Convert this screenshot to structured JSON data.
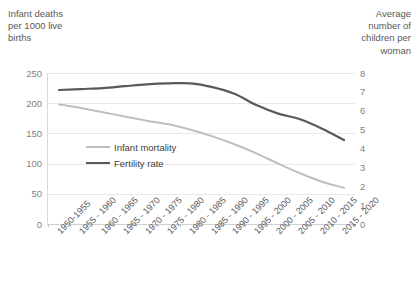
{
  "chart_data": {
    "type": "line",
    "title": "",
    "subtitle": "",
    "xlabel": "",
    "ylabel": "Infant deaths per 1000 live births",
    "y2label": "Average number of children per woman",
    "grid": true,
    "legend_position": "inside-left",
    "categories": [
      "1950-1955",
      "1955 - 1960",
      "1960 - 1965",
      "1965 - 1970",
      "1970 - 1975",
      "1975 - 1980",
      "1980 - 1985",
      "1985 - 1990",
      "1990 - 1995",
      "1995 - 2000",
      "2000 - 2005",
      "2005 - 2010",
      "2010 - 2015",
      "2015 - 2020"
    ],
    "ylim": [
      0,
      250
    ],
    "y2lim": [
      0,
      8
    ],
    "yticks": [
      "0",
      "50",
      "100",
      "150",
      "200",
      "250"
    ],
    "y2ticks": [
      "0",
      "1",
      "2",
      "3",
      "4",
      "5",
      "6",
      "7",
      "8"
    ],
    "ytick_values": [
      0,
      50,
      100,
      150,
      200,
      250
    ],
    "y2tick_values": [
      0,
      1,
      2,
      3,
      4,
      5,
      6,
      7,
      8
    ],
    "series": [
      {
        "name": "Infant mortality",
        "axis": "left",
        "color": "#bfbfbf",
        "width": 2,
        "values": [
          198,
          192,
          185,
          178,
          171,
          165,
          156,
          145,
          132,
          117,
          100,
          84,
          70,
          60
        ]
      },
      {
        "name": "Fertility rate",
        "axis": "right",
        "color": "#595959",
        "width": 2.2,
        "values": [
          7.1,
          7.15,
          7.2,
          7.3,
          7.4,
          7.45,
          7.45,
          7.25,
          6.9,
          6.3,
          5.85,
          5.55,
          5.05,
          4.45
        ]
      }
    ],
    "legend": [
      {
        "label": "Infant mortality",
        "color": "#bfbfbf"
      },
      {
        "label": "Fertility rate",
        "color": "#595959"
      }
    ]
  },
  "colors": {
    "infant_mortality": "#bfbfbf",
    "fertility_rate": "#595959",
    "gridline": "#e8e8e8",
    "tick_text": "#7f7f7f",
    "axis_title_text": "#595959",
    "background": "#ffffff"
  },
  "axis_titles": {
    "left": "Infant deaths\nper 1000 live\nbirths",
    "right": "Average\nnumber of\nchildren per\nwoman"
  }
}
